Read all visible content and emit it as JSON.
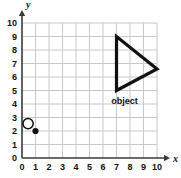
{
  "chart_data": {
    "type": "scatter",
    "title": "",
    "xlabel": "x",
    "ylabel": "y",
    "xlim": [
      0,
      10
    ],
    "ylim": [
      0,
      10
    ],
    "grid": true,
    "legend": false,
    "x_ticks": [
      "0",
      "1",
      "2",
      "3",
      "4",
      "5",
      "6",
      "7",
      "8",
      "9",
      "10"
    ],
    "y_ticks": [
      "0",
      "1",
      "2",
      "3",
      "4",
      "5",
      "6",
      "7",
      "8",
      "9",
      "10"
    ],
    "series": [
      {
        "name": "object",
        "type": "polygon",
        "label": "object",
        "label_x": 7.6,
        "label_y": 4.0,
        "closed": true,
        "points": [
          {
            "x": 7,
            "y": 9
          },
          {
            "x": 7,
            "y": 5
          },
          {
            "x": 10,
            "y": 6.6
          }
        ]
      },
      {
        "name": "origin-marker",
        "type": "open-circle",
        "x": 0.45,
        "y": 2.55,
        "radius": 0.38
      },
      {
        "name": "plotted-point",
        "type": "filled-point",
        "x": 1,
        "y": 2
      }
    ],
    "colors": {
      "grid": "#c8c8c8",
      "axis": "#3a3a3a",
      "shape": "#111111",
      "point": "#111111",
      "background": "#ffffff"
    }
  },
  "geometry": {
    "origin_px_x": 22,
    "origin_px_y": 158,
    "unit_px": 13.5
  }
}
